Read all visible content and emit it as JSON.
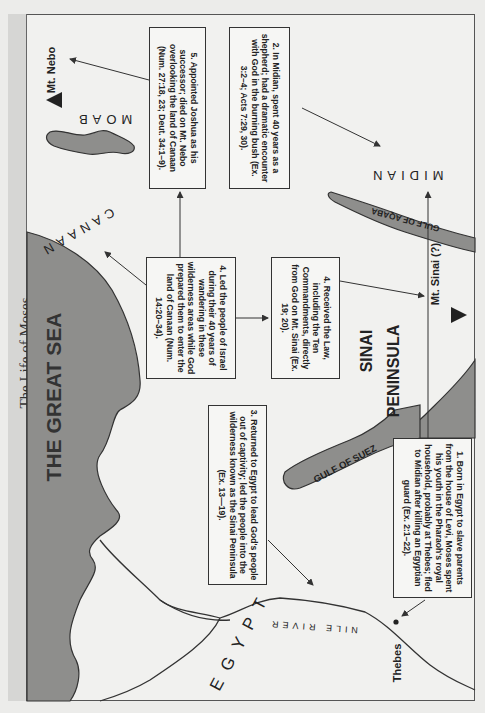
{
  "page": {
    "title": "The Life of Moses",
    "colors": {
      "sea": "#8e8e8c",
      "land": "#f1f1ef",
      "border": "#333333",
      "title_strip": "#d6d6d4"
    }
  },
  "map": {
    "regions": {
      "great_sea": "THE GREAT SEA",
      "canaan": "CANAAN",
      "moab": "MOAB",
      "midian": "MIDIAN",
      "sinai_1": "SINAI",
      "sinai_2": "PENINSULA",
      "egypt": "EGYPT",
      "gulf_aqaba": "GULF OF AQABA",
      "gulf_suez": "GULF OF SUEZ",
      "nile": "NILE RIVER"
    },
    "places": {
      "mt_nebo": "Mt. Nebo",
      "mt_sinai": "Mt. Sinai (?)",
      "thebes": "Thebes"
    }
  },
  "events": [
    {
      "id": "1",
      "text": "1. Born in Egypt to slave parents from the house of Levi, Moses spent his youth in the Pharaoh's royal household, probably at Thebes; fled to Midian after killing an Egyptian guard (Ex. 2:1–22)."
    },
    {
      "id": "2",
      "text": "2. In Midian, spent 40 years as a shepherd; had a dramatic encounter with God in the burning bush (Ex. 3:2–4; Acts 7:29, 30)."
    },
    {
      "id": "3",
      "text": "3. Returned to Egypt to lead God's people out of captivity; led the people into the wilderness known as the Sinai Peninsula (Ex. 13—19)."
    },
    {
      "id": "4a",
      "text": "4. Received the Law, including the Ten Commandments, directly from God on Mt. Sinai (Ex. 19; 20)."
    },
    {
      "id": "4b",
      "text": "4. Led the people of Israel during their 40 years of wandering in these wilderness areas while God prepared them to enter the land of Canaan (Num. 14:20–34)."
    },
    {
      "id": "5",
      "text": "5. Appointed Joshua as his successor; died on Mt. Nebo overlooking the land of Canaan (Num. 27:18, 23; Deut. 34:1–9)."
    }
  ]
}
